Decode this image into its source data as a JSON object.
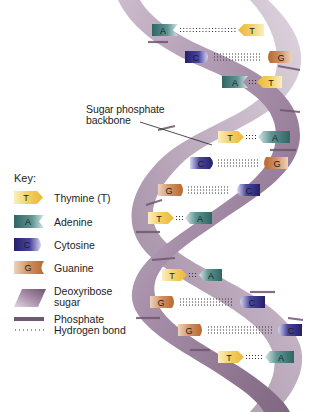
{
  "diagram": {
    "callout": {
      "line1": "Sugar phosphate",
      "line2": "backbone"
    },
    "key": {
      "title": "Key:",
      "items": [
        {
          "symbol": "T",
          "label": "Thymine (T)",
          "color": "#f0c64a",
          "shape": "arrow-right"
        },
        {
          "symbol": "A",
          "label": "Adenine",
          "color": "#3f7a78",
          "shape": "notch-right"
        },
        {
          "symbol": "C",
          "label": "Cytosine",
          "color": "#2e2a78",
          "shape": "round-right"
        },
        {
          "symbol": "G",
          "label": "Guanine",
          "color": "#c27a48",
          "shape": "notch-curve-right"
        },
        {
          "symbol": "",
          "label_line1": "Deoxyribose",
          "label_line2": "sugar",
          "color": "#8f7390",
          "shape": "parallelogram"
        },
        {
          "symbol": "",
          "label": "Phosphate",
          "color": "#6e5770",
          "shape": "bar"
        },
        {
          "symbol": "",
          "label": "Hydrogen bond",
          "color": "#333333",
          "shape": "dots"
        }
      ]
    },
    "base_pairs": [
      {
        "left": "A",
        "right": "T",
        "bonds": 2
      },
      {
        "left": "C",
        "right": "G",
        "bonds": 3
      },
      {
        "left": "A",
        "right": "T",
        "bonds": 2
      },
      {
        "left": "T",
        "right": "A",
        "bonds": 2
      },
      {
        "left": "C",
        "right": "G",
        "bonds": 3
      },
      {
        "left": "G",
        "right": "C",
        "bonds": 3
      },
      {
        "left": "T",
        "right": "A",
        "bonds": 2
      },
      {
        "left": "T",
        "right": "A",
        "bonds": 2
      },
      {
        "left": "G",
        "right": "C",
        "bonds": 3
      },
      {
        "left": "G",
        "right": "C",
        "bonds": 3
      },
      {
        "left": "T",
        "right": "A",
        "bonds": 2
      }
    ],
    "colors": {
      "backbone_light": "#b9a6bb",
      "backbone_mid": "#9c829e",
      "backbone_dark": "#6e5770",
      "thymine": "#f0c64a",
      "adenine": "#3f7a78",
      "cytosine": "#2e2a78",
      "guanine": "#c27a48"
    }
  }
}
